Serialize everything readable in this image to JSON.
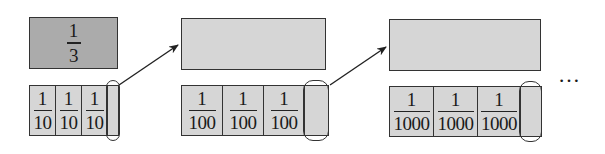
{
  "stages": [
    {
      "top_box": {
        "label_num": "1",
        "label_den": "3",
        "fill": "#ababab"
      },
      "bottom_row": {
        "cells": [
          {
            "num": "1",
            "den": "10"
          },
          {
            "num": "1",
            "den": "10"
          },
          {
            "num": "1",
            "den": "10"
          }
        ],
        "remainder_circled": true
      }
    },
    {
      "top_box": {
        "label_num": "",
        "label_den": "",
        "fill": "#d6d6d6"
      },
      "bottom_row": {
        "cells": [
          {
            "num": "1",
            "den": "100"
          },
          {
            "num": "1",
            "den": "100"
          },
          {
            "num": "1",
            "den": "100"
          }
        ],
        "remainder_circled": true
      }
    },
    {
      "top_box": {
        "label_num": "",
        "label_den": "",
        "fill": "#d6d6d6"
      },
      "bottom_row": {
        "cells": [
          {
            "num": "1",
            "den": "1000"
          },
          {
            "num": "1",
            "den": "1000"
          },
          {
            "num": "1",
            "den": "1000"
          }
        ],
        "remainder_circled": true
      }
    }
  ],
  "arrows": [
    {
      "from": "stage-1-remainder",
      "to": "stage-2-top-box"
    },
    {
      "from": "stage-2-remainder",
      "to": "stage-3-top-box"
    }
  ],
  "continuation": "…"
}
